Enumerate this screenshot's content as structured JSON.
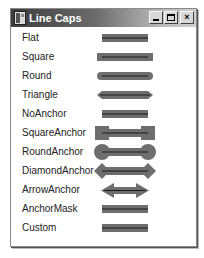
{
  "window": {
    "title": "Line Caps",
    "icon": "app-window-icon",
    "controls": {
      "minimize": "minimize-icon",
      "maximize": "maximize-icon",
      "close": "close-icon",
      "close_glyph": "×"
    }
  },
  "colors": {
    "cap_fill": "#6e6e6e",
    "center_line": "#1a1a1a",
    "title_start": "#3c3c3c",
    "title_end": "#cfcfcf"
  },
  "rows": [
    {
      "label": "Flat",
      "cap": "flat"
    },
    {
      "label": "Square",
      "cap": "square"
    },
    {
      "label": "Round",
      "cap": "round"
    },
    {
      "label": "Triangle",
      "cap": "triangle"
    },
    {
      "label": "NoAnchor",
      "cap": "noanchor"
    },
    {
      "label": "SquareAnchor",
      "cap": "squareanchor"
    },
    {
      "label": "RoundAnchor",
      "cap": "roundanchor"
    },
    {
      "label": "DiamondAnchor",
      "cap": "diamondanchor"
    },
    {
      "label": "ArrowAnchor",
      "cap": "arrowanchor"
    },
    {
      "label": "AnchorMask",
      "cap": "anchormask"
    },
    {
      "label": "Custom",
      "cap": "custom"
    }
  ]
}
